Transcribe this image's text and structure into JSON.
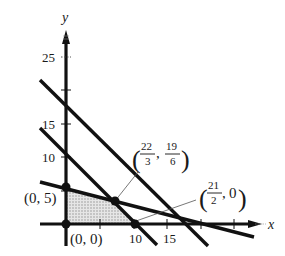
{
  "figure": {
    "type": "linear-programming-feasible-region",
    "axes": {
      "x_label": "x",
      "y_label": "y",
      "y_tick_labels": [
        {
          "value": 25,
          "text": "25"
        },
        {
          "value": 15,
          "text": "15"
        },
        {
          "value": 10,
          "text": "10"
        }
      ],
      "x_tick_labels": [
        {
          "value": 10,
          "text": "10"
        },
        {
          "value": 15,
          "text": "15"
        }
      ],
      "y_ticks": [
        5,
        10,
        15,
        20,
        25
      ],
      "x_ticks": [
        5,
        10,
        15,
        20,
        25
      ]
    },
    "vertices": [
      {
        "name": "origin",
        "text": "(0, 0)",
        "x": 0,
        "y": 0
      },
      {
        "name": "y-intercept",
        "text": "(0, 5)",
        "x": 0,
        "y": 5
      },
      {
        "name": "intersection",
        "text_open": "(",
        "num1": "22",
        "den1": "3",
        "sep": ",",
        "num2": "19",
        "den2": "6",
        "text_close": ")",
        "x": 7.333,
        "y": 3.167
      },
      {
        "name": "x-intercept",
        "text_open": "(",
        "num1": "21",
        "den1": "2",
        "sep": ",",
        "tail": "0",
        "text_close": ")",
        "x": 10.5,
        "y": 0
      }
    ],
    "shaded_region": "feasible region bounded by (0,0), (0,5), (22/3,19/6), (21/2,0)",
    "colors": {
      "line": "#111111",
      "axis": "#111111",
      "shade": "#c8c8c8",
      "leader": "#555555"
    }
  }
}
